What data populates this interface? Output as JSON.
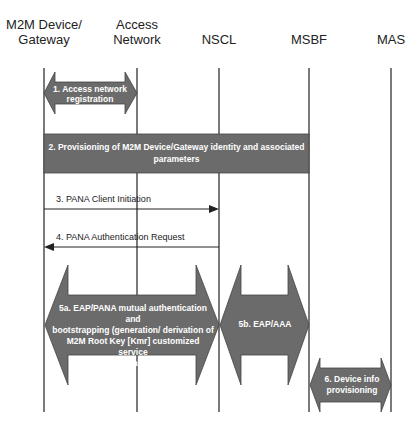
{
  "entities": [
    {
      "name": "M2M Device/ Gateway",
      "line1": "M2M Device/",
      "line2": "Gateway",
      "x": 44
    },
    {
      "name": "Access Network",
      "line1": "Access",
      "line2": "Network",
      "x": 137
    },
    {
      "name": "NSCL",
      "line1": "",
      "line2": "NSCL",
      "x": 219
    },
    {
      "name": "MSBF",
      "line1": "",
      "line2": "MSBF",
      "x": 309
    },
    {
      "name": "MAS",
      "line1": "",
      "line2": "MAS",
      "x": 391
    }
  ],
  "steps": {
    "s1": {
      "line1": "1. Access network",
      "line2": "registration"
    },
    "s2": {
      "line1": "2. Provisioning of M2M Device/Gateway identity and associated",
      "line2": "parameters"
    },
    "s3": {
      "label": "3. PANA Client Initiation",
      "from": "M2M Device/ Gateway",
      "to": "NSCL"
    },
    "s4": {
      "label": "4. PANA Authentication Request",
      "from": "NSCL",
      "to": "M2M Device/ Gateway"
    },
    "s5a": {
      "line1": "5a. EAP/PANA mutual authentication and",
      "line2": "bootstrapping (generation/ derivation of",
      "line3": "M2M Root Key [Kmr] customized service",
      "line4": "layer parameters)"
    },
    "s5b": {
      "label": "5b. EAP/AAA"
    },
    "s6": {
      "line1": "6. Device info",
      "line2": "provisioning"
    }
  },
  "colors": {
    "shape_fill": "#6b6b6b",
    "line": "#333333",
    "text_on_shape": "#ffffff"
  }
}
